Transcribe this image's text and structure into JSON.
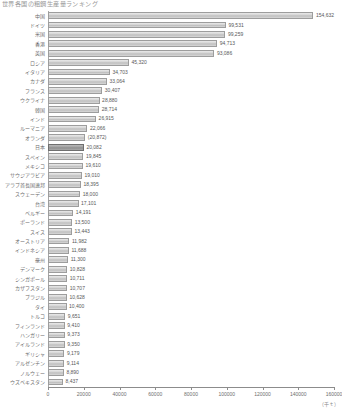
{
  "title": "世界各国の粗鋼生産量ランキング",
  "axis_unit": "（千ｔ）",
  "highlight_category": "日本",
  "chart_data": {
    "type": "bar",
    "orientation": "horizontal",
    "title": "世界各国の粗鋼生産量ランキング",
    "xlabel": "（千ｔ）",
    "ylabel": "",
    "xlim": [
      0,
      160000
    ],
    "xticks": [
      0,
      20000,
      40000,
      60000,
      80000,
      100000,
      120000,
      140000,
      160000
    ],
    "xtick_labels": [
      "0",
      "20000",
      "40000",
      "60000",
      "80000",
      "100000",
      "120000",
      "140000",
      "160000"
    ],
    "grid": false,
    "legend": "none",
    "categories": [
      "中国",
      "ドイツ",
      "米国",
      "香港",
      "英国",
      "ロシア",
      "イタリア",
      "カナダ",
      "フランス",
      "ウクライナ",
      "韓国",
      "インド",
      "ルーマニア",
      "オランダ",
      "日本",
      "スペイン",
      "メキシコ",
      "サウジアラビア",
      "アラブ首長国連邦",
      "スウェーデン",
      "台湾",
      "ベルギー",
      "ポーランド",
      "スイス",
      "オーストリア",
      "インドネシア",
      "豪州",
      "デンマーク",
      "シンガポール",
      "カザフスタン",
      "ブラジル",
      "タイ",
      "トルコ",
      "フィンランド",
      "ハンガリー",
      "アイルランド",
      "ギリシャ",
      "アルゼンチン",
      "ノルウェー",
      "ウズベキスタン"
    ],
    "values": [
      154632,
      99531,
      99259,
      94713,
      93086,
      45320,
      34703,
      33064,
      30407,
      28880,
      28714,
      26915,
      22066,
      20872,
      20082,
      19845,
      19610,
      19010,
      18395,
      18000,
      17101,
      14191,
      13500,
      13443,
      11982,
      11688,
      11300,
      10828,
      10711,
      10707,
      10628,
      10400,
      9651,
      9410,
      9373,
      9350,
      9179,
      9114,
      8890,
      8437
    ],
    "value_labels": [
      "154,632",
      "99,531",
      "99,259",
      "94,713",
      "93,086",
      "45,320",
      "34,703",
      "33,064",
      "30,407",
      "28,880",
      "28,714",
      "26,915",
      "22,066",
      "(20,872)",
      "20,082",
      "19,845",
      "19,610",
      "19,010",
      "18,395",
      "18,000",
      "17,101",
      "14,191",
      "13,500",
      "13,443",
      "11,982",
      "11,688",
      "11,300",
      "10,828",
      "10,711",
      "10,707",
      "10,628",
      "10,400",
      "9,651",
      "9,410",
      "9,373",
      "9,350",
      "9,179",
      "9,114",
      "8,890",
      "8,437"
    ]
  }
}
